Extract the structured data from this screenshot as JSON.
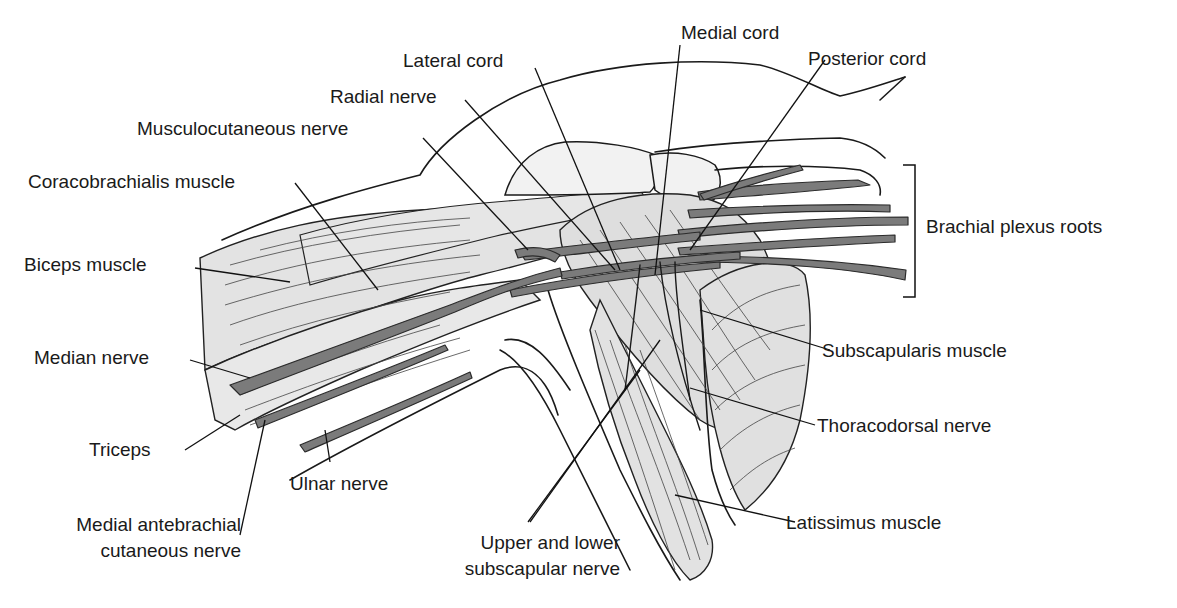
{
  "figure": {
    "colors": {
      "nerve_fill": "#7b7b7b",
      "muscle_fill": "#e3e3e3",
      "line": "#1a1a1a",
      "background": "#ffffff"
    }
  },
  "labels": {
    "lateral_cord": "Lateral cord",
    "medial_cord": "Medial cord",
    "posterior_cord": "Posterior cord",
    "radial_nerve": "Radial nerve",
    "musculocutaneous_nerve": "Musculocutaneous nerve",
    "coracobrachialis_muscle": "Coracobrachialis muscle",
    "biceps_muscle": "Biceps muscle",
    "brachial_plexus_roots": "Brachial plexus roots",
    "subscapularis_muscle": "Subscapularis muscle",
    "median_nerve": "Median nerve",
    "thoracodorsal_nerve": "Thoracodorsal nerve",
    "triceps": "Triceps",
    "ulnar_nerve": "Ulnar nerve",
    "medial_antebrachial_line1": "Medial antebrachial",
    "medial_antebrachial_line2": "cutaneous nerve",
    "latissimus_muscle": "Latissimus muscle",
    "upper_lower_subscapular_line1": "Upper and lower",
    "upper_lower_subscapular_line2": "subscapular nerve"
  }
}
